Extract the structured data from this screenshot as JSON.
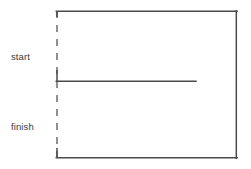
{
  "diagram": {
    "type": "timeline-box-diagram",
    "title": "",
    "background_color": "#ffffff",
    "line_color": "#4a4a4a",
    "dashed_line_color": "#6b6b6b",
    "text_color": "#3b3b3b",
    "labels": [
      {
        "id": "start",
        "text": "start"
      },
      {
        "id": "finish",
        "text": "finish"
      }
    ],
    "shapes": {
      "outer_box": {
        "name": "main-rectangle",
        "left": 57,
        "top": 11,
        "right": 237,
        "bottom": 158,
        "stroke": "#4a4a4a",
        "stroke_width": 1.4,
        "left_edge_style": "dashed"
      },
      "dashed_left_edge": {
        "name": "dashed-left-edge",
        "x": 57,
        "y_start": 11,
        "y_end": 158,
        "dash": "7 7",
        "stroke": "#6b6b6b",
        "stroke_width": 1.4
      },
      "middle_divider": {
        "name": "middle-divider-line",
        "x_start": 57,
        "x_end": 196,
        "y": 81,
        "stroke": "#4a4a4a",
        "stroke_width": 1.4
      },
      "divider_corner_stub": {
        "name": "divider-corner-stub",
        "x": 57,
        "y_start": 71,
        "y_end": 81,
        "stroke": "#4a4a4a",
        "stroke_width": 1.4
      },
      "bottom_corner_stub": {
        "name": "bottom-corner-stub",
        "x": 57,
        "y_start": 149,
        "y_end": 158,
        "stroke": "#4a4a4a",
        "stroke_width": 1.4
      },
      "top_corner_stub": {
        "name": "top-corner-stub",
        "x": 57,
        "y_start": 11,
        "y_end": 17,
        "stroke": "#4a4a4a",
        "stroke_width": 1.4
      }
    }
  }
}
